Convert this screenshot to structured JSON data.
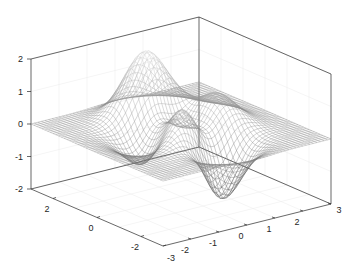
{
  "chart_data": {
    "type": "mesh3d",
    "title": "",
    "function": "peaks",
    "xlabel": "",
    "ylabel": "",
    "zlabel": "",
    "xlim": [
      -3,
      3
    ],
    "ylim": [
      -3,
      3
    ],
    "zlim": [
      -2,
      2
    ],
    "x_ticks": [
      -2,
      -1,
      0,
      1,
      2,
      3
    ],
    "y_ticks": [
      -3,
      -2,
      0,
      2
    ],
    "z_ticks": [
      -2,
      -1,
      0,
      1,
      2
    ],
    "grid": true,
    "grid_resolution": 49,
    "z_scale": 0.25,
    "features": [
      {
        "type": "peak",
        "approx_x": 0,
        "approx_y": 1.6,
        "approx_z": 2.0
      },
      {
        "type": "trough",
        "approx_x": 0.2,
        "approx_y": -1.6,
        "approx_z": -2.0
      },
      {
        "type": "ridge",
        "approx_x": -0.5,
        "approx_y": 0,
        "approx_z": 1.0
      }
    ],
    "colors": {
      "axis": "#262626",
      "grid": "#ebebeb",
      "mesh_low": "#303030",
      "mesh_high": "#d0d0d0"
    }
  },
  "axes": {
    "z_tick_labels": [
      "-2",
      "-1",
      "0",
      "1",
      "2"
    ],
    "x_tick_labels": [
      "-2",
      "-1",
      "0",
      "1",
      "2",
      "3"
    ],
    "y_tick_labels": [
      "-3",
      "-2",
      "0",
      "2"
    ]
  }
}
